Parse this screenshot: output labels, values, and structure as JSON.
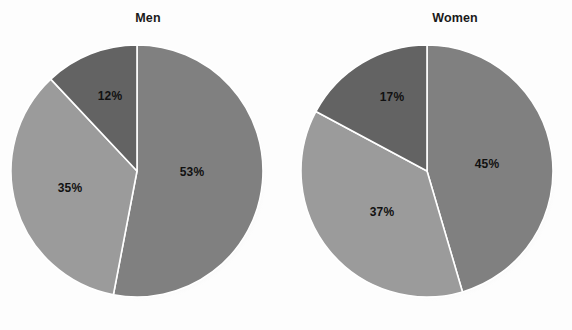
{
  "figure": {
    "background_color": "#fdfdfd",
    "width": 572,
    "height": 330
  },
  "chart_data": [
    {
      "type": "pie",
      "title": "Men",
      "categories": [
        "53%",
        "35%",
        "12%"
      ],
      "values": [
        53,
        35,
        12
      ],
      "labels": [
        "53%",
        "35%",
        "12%"
      ],
      "colors": [
        "#808080",
        "#9b9b9b",
        "#636363"
      ],
      "start_angle_deg": 0,
      "direction": "clockwise",
      "legend": "none",
      "grid": false,
      "center": {
        "x": 137,
        "y": 171
      },
      "radius": 126,
      "label_positions": [
        {
          "text": "53%",
          "x": 192,
          "y": 172
        },
        {
          "text": "35%",
          "x": 70,
          "y": 188
        },
        {
          "text": "12%",
          "x": 110,
          "y": 96
        }
      ],
      "title_position": {
        "x": 148,
        "y": 11
      }
    },
    {
      "type": "pie",
      "title": "Women",
      "categories": [
        "45%",
        "37%",
        "17%"
      ],
      "values": [
        45,
        37,
        17
      ],
      "labels": [
        "45%",
        "37%",
        "17%"
      ],
      "colors": [
        "#808080",
        "#9b9b9b",
        "#636363"
      ],
      "start_angle_deg": 0,
      "direction": "clockwise",
      "legend": "none",
      "grid": false,
      "center": {
        "x": 427,
        "y": 171
      },
      "radius": 126,
      "label_positions": [
        {
          "text": "45%",
          "x": 487,
          "y": 164
        },
        {
          "text": "37%",
          "x": 382,
          "y": 212
        },
        {
          "text": "17%",
          "x": 392,
          "y": 97
        }
      ],
      "title_position": {
        "x": 455,
        "y": 11
      }
    }
  ],
  "charts": {
    "men": {
      "title": "Men",
      "slice_1_label": "53%",
      "slice_2_label": "35%",
      "slice_3_label": "12%"
    },
    "women": {
      "title": "Women",
      "slice_1_label": "45%",
      "slice_2_label": "37%",
      "slice_3_label": "17%"
    }
  },
  "colors": {
    "slice_medium": "#808080",
    "slice_light": "#9b9b9b",
    "slice_dark": "#636363",
    "divider": "#ffffff",
    "label_text": "#111111",
    "title_text": "#1a1a1a"
  }
}
